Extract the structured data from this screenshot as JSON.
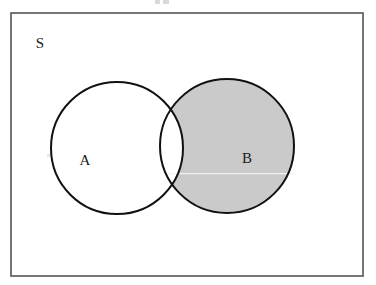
{
  "figure": {
    "kind": "venn-diagram",
    "width": 376,
    "height": 285
  },
  "universe": {
    "label": "S",
    "label_x": 40,
    "label_y": 45,
    "rect": {
      "x": 11,
      "y": 13,
      "width": 352,
      "height": 263
    },
    "border_color": "#555555",
    "border_width": 1.6,
    "fill_color": "#ffffff"
  },
  "sets": [
    {
      "name": "set-a",
      "label": "A",
      "label_x": 85,
      "label_y": 162,
      "cx": 117,
      "cy": 148,
      "r": 66,
      "fill_color": "#ffffff",
      "stroke_color": "#111111",
      "stroke_width": 2.0,
      "shaded": false
    },
    {
      "name": "set-b",
      "label": "B",
      "label_x": 247,
      "label_y": 160,
      "cx": 227,
      "cy": 146,
      "r": 67,
      "fill_color": "#c9cac9",
      "stroke_color": "#111111",
      "stroke_width": 2.0,
      "shaded": true
    }
  ],
  "shading": {
    "region": "B-minus-A",
    "shade_color": "#c9cac9",
    "intersection_fill": "#ffffff"
  },
  "artifacts": {
    "scanline": {
      "name": "scan-line-artifact",
      "x": 168,
      "y": 173,
      "width": 126,
      "height": 1,
      "color": "#f2f2f2"
    },
    "top_specks": [
      {
        "x": 155,
        "y": 0,
        "width": 5,
        "height": 4
      },
      {
        "x": 163,
        "y": 0,
        "width": 6,
        "height": 4
      }
    ],
    "edge_speck": {
      "x": 47,
      "y": 154,
      "width": 3,
      "height": 3
    }
  }
}
